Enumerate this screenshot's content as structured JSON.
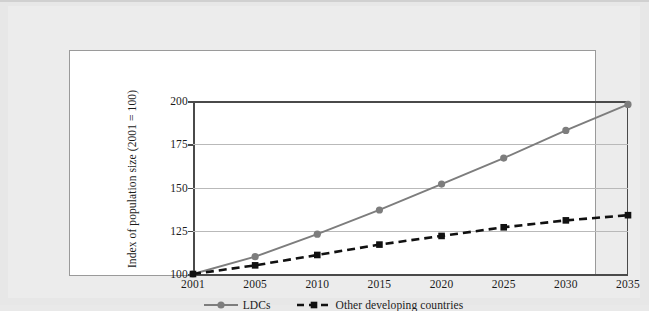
{
  "chart_data": {
    "type": "line",
    "title": "",
    "xlabel": "",
    "ylabel": "Index of population size (2001 = 100)",
    "categories": [
      "2001",
      "2005",
      "2010",
      "2015",
      "2020",
      "2025",
      "2030",
      "2035"
    ],
    "x": [
      2001,
      2005,
      2010,
      2015,
      2020,
      2025,
      2030,
      2035
    ],
    "ylim": [
      100,
      200
    ],
    "yticks": [
      100,
      125,
      150,
      175,
      200
    ],
    "ytick_labels": [
      "100",
      "125",
      "150",
      "175",
      "200"
    ],
    "grid": true,
    "legend_position": "bottom-center",
    "series": [
      {
        "name": "LDCs",
        "values": [
          100,
          110,
          123,
          137,
          152,
          167,
          183,
          198
        ],
        "color": "#7d7d7d",
        "line_style": "solid",
        "marker": "circle"
      },
      {
        "name": "Other developing countries",
        "values": [
          100,
          105,
          111,
          117,
          122,
          127,
          131,
          134
        ],
        "color": "#111111",
        "line_style": "dashed",
        "marker": "square"
      }
    ]
  },
  "legend": {
    "entries": [
      {
        "label": "LDCs"
      },
      {
        "label": "Other developing countries"
      }
    ]
  },
  "colors": {
    "page_background": "#e7e7e7",
    "panel_background": "#ffffff",
    "panel_border": "#9a9a9a",
    "axis": "#4a4a4a",
    "gridline": "#b9b9b9",
    "ldc_series": "#7d7d7d",
    "other_series": "#111111",
    "text": "#1b1b1b"
  }
}
